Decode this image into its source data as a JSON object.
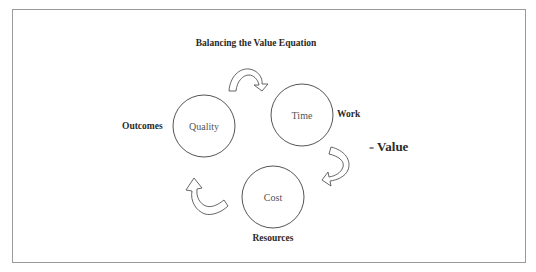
{
  "diagram": {
    "title": "Balancing the Value Equation",
    "nodes": [
      {
        "id": "quality",
        "label": "Quality",
        "caption": "Outcomes",
        "cx": 204,
        "cy": 126,
        "r": 31
      },
      {
        "id": "time",
        "label": "Time",
        "caption": "Work",
        "cx": 302,
        "cy": 115,
        "r": 31
      },
      {
        "id": "cost",
        "label": "Cost",
        "caption": "Resources",
        "cx": 273,
        "cy": 197,
        "r": 31
      }
    ],
    "arrows": [
      {
        "from": "quality",
        "to": "time"
      },
      {
        "from": "time",
        "to": "cost"
      },
      {
        "from": "cost",
        "to": "quality"
      }
    ],
    "result": {
      "equals": "=",
      "label": "Value"
    },
    "colors": {
      "stroke": "#555555",
      "frame": "#9a9a9a",
      "text": "#2a2a2a"
    }
  }
}
